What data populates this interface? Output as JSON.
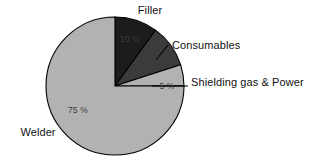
{
  "chart_data": {
    "type": "pie",
    "title": "",
    "subtitle": "",
    "xlabel": "",
    "ylabel": "",
    "legend_position": "none",
    "grid": false,
    "start_angle_deg": 0,
    "direction": "clockwise",
    "categories": [
      "Filler",
      "Consumables",
      "Shielding gas & Power",
      "Welder"
    ],
    "values": [
      10,
      10,
      5,
      75
    ],
    "value_labels": [
      "10 %",
      "10 %",
      "5 %",
      "75 %"
    ],
    "unit": "%",
    "colors": [
      "#1c1c1c",
      "#3b3b3b",
      "#b2b2b2",
      "#b2b2b2"
    ],
    "slices": [
      {
        "name": "Filler",
        "value": 10,
        "value_label": "10 %",
        "color": "#1c1c1c",
        "start_deg": 0,
        "end_deg": 36,
        "label_placement": "outside-top",
        "pct_text_x": 130,
        "pct_text_y": 42,
        "cat_text_x": 150,
        "cat_text_y": 14,
        "cat_anchor": "middle",
        "has_leader": false
      },
      {
        "name": "Consumables",
        "value": 10,
        "value_label": "10 %",
        "color": "#3b3b3b",
        "start_deg": 36,
        "end_deg": 72,
        "label_placement": "outside-right",
        "pct_text_x": 160,
        "pct_text_y": 62,
        "cat_text_x": 172,
        "cat_text_y": 49,
        "cat_anchor": "start",
        "has_leader": true,
        "leader_points": "156,60 168,45"
      },
      {
        "name": "Shielding gas & Power",
        "value": 5,
        "value_label": "5 %",
        "color": "#b2b2b2",
        "start_deg": 72,
        "end_deg": 90,
        "label_placement": "outside-right",
        "pct_text_x": 167,
        "pct_text_y": 89,
        "cat_text_x": 191,
        "cat_text_y": 86,
        "cat_anchor": "start",
        "has_leader": true,
        "leader_points": "152,86 188,86"
      },
      {
        "name": "Welder",
        "value": 75,
        "value_label": "75 %",
        "color": "#b2b2b2",
        "start_deg": 90,
        "end_deg": 360,
        "label_placement": "outside-left",
        "pct_text_x": 78,
        "pct_text_y": 113,
        "cat_text_x": 38,
        "cat_text_y": 136,
        "cat_anchor": "middle",
        "has_leader": false
      }
    ],
    "geometry": {
      "center_x": 115,
      "center_y": 86,
      "radius": 69
    },
    "style": {
      "background": "#ffffff",
      "outline": "#000000",
      "text_color": "#111111"
    }
  }
}
